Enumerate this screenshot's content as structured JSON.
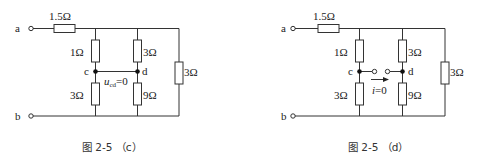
{
  "figures": [
    {
      "id": "c",
      "caption": "图 2-5 （c）",
      "terminals": {
        "a": "a",
        "b": "b"
      },
      "nodes": {
        "c": "c",
        "d": "d"
      },
      "resistors": {
        "series_top": "1.5Ω",
        "c_top": "1Ω",
        "c_bottom": "3Ω",
        "d_top": "3Ω",
        "d_bottom": "9Ω",
        "right": "3Ω"
      },
      "annotation": {
        "var": "u",
        "sub": "cd",
        "rest": "=0"
      }
    },
    {
      "id": "d",
      "caption": "图 2-5 （d）",
      "terminals": {
        "a": "a",
        "b": "b"
      },
      "nodes": {
        "c": "c",
        "d": "d"
      },
      "resistors": {
        "series_top": "1.5Ω",
        "c_top": "1Ω",
        "c_bottom": "3Ω",
        "d_top": "3Ω",
        "d_bottom": "9Ω",
        "right": "3Ω"
      },
      "annotation": {
        "var": "i",
        "rest": "=0"
      }
    }
  ]
}
